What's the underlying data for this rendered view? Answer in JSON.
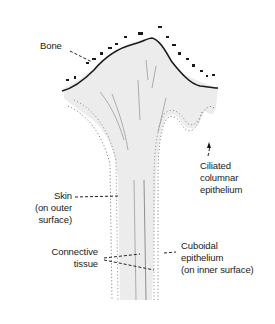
{
  "diagram": {
    "type": "anatomical-illustration",
    "labels": {
      "bone": "Bone",
      "skin": [
        "Skin",
        "(on outer",
        "surface)"
      ],
      "connective": [
        "Connective",
        "tissue"
      ],
      "ciliated": [
        "Ciliated",
        "columnar",
        "epithelium"
      ],
      "cuboidal": [
        "Cuboidal",
        "epithelium",
        "(on inner surface)"
      ]
    },
    "colors": {
      "tissue_fill": "#e9e9e9",
      "outline": "#1a1a1a",
      "leader": "#222222",
      "dots": "#777777"
    }
  }
}
